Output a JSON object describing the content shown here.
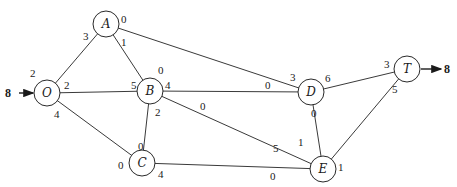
{
  "diagram": {
    "type": "flow-network",
    "nodes": [
      {
        "id": "A",
        "label": "A",
        "x": 106,
        "y": 24
      },
      {
        "id": "O",
        "label": "O",
        "x": 47,
        "y": 93
      },
      {
        "id": "B",
        "label": "B",
        "x": 150,
        "y": 91
      },
      {
        "id": "C",
        "label": "C",
        "x": 142,
        "y": 163
      },
      {
        "id": "D",
        "label": "D",
        "x": 311,
        "y": 92
      },
      {
        "id": "E",
        "label": "E",
        "x": 323,
        "y": 169
      },
      {
        "id": "T",
        "label": "T",
        "x": 407,
        "y": 69
      }
    ],
    "edges": [
      {
        "from": "O",
        "to": "A",
        "cap_from": "2",
        "cap_to": "3"
      },
      {
        "from": "O",
        "to": "B",
        "cap_from": "2",
        "cap_to": "5"
      },
      {
        "from": "O",
        "to": "C",
        "cap_from": "4",
        "cap_to": "0"
      },
      {
        "from": "A",
        "to": "B",
        "cap_from": "1",
        "cap_to": "0"
      },
      {
        "from": "A",
        "to": "D",
        "cap_from": "0",
        "cap_to": "3"
      },
      {
        "from": "B",
        "to": "C",
        "cap_from": "2",
        "cap_to": "0"
      },
      {
        "from": "B",
        "to": "D",
        "cap_from": "4",
        "cap_to": "0"
      },
      {
        "from": "B",
        "to": "E",
        "cap_from": "0",
        "cap_to": "5"
      },
      {
        "from": "C",
        "to": "E",
        "cap_from": "4",
        "cap_to": "0"
      },
      {
        "from": "D",
        "to": "E",
        "cap_from": "0",
        "cap_to": "1"
      },
      {
        "from": "D",
        "to": "T",
        "cap_from": "6",
        "cap_to": "3"
      },
      {
        "from": "E",
        "to": "T",
        "cap_from": "1",
        "cap_to": "5"
      }
    ],
    "source_flow": "8",
    "sink_flow": "8"
  },
  "labels": {
    "A": "A",
    "O": "O",
    "B": "B",
    "C": "C",
    "D": "D",
    "E": "E",
    "T": "T",
    "in_flow": "8",
    "out_flow": "8",
    "OA_O": "2",
    "OA_A": "3",
    "OB_O": "2",
    "OB_B": "5",
    "OC_O": "4",
    "OC_C": "0",
    "AB_A": "1",
    "AB_B": "0",
    "AD_A": "0",
    "AD_D": "3",
    "BC_B": "2",
    "BC_C": "0",
    "BD_B": "4",
    "BD_D": "0",
    "BE_B": "0",
    "BE_E": "5",
    "CE_C": "4",
    "CE_E": "0",
    "DE_D": "0",
    "DE_E": "1",
    "DT_D": "6",
    "DT_T": "3",
    "ET_E": "1",
    "ET_T": "5"
  }
}
